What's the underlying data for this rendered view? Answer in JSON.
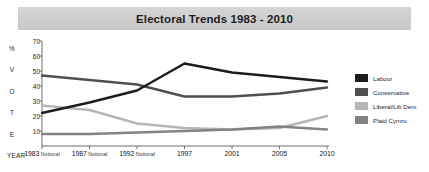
{
  "title": "Electoral Trends 1983 - 2010",
  "axis": {
    "vertical_letters": [
      "%",
      "V",
      "O",
      "T",
      "E"
    ],
    "year_label": "YEAR",
    "yticks": [
      70,
      60,
      50,
      40,
      30,
      20,
      10
    ]
  },
  "legend": [
    {
      "label": "Labour",
      "color": "#1c1c1c"
    },
    {
      "label": "Conservative",
      "color": "#4f4f4f"
    },
    {
      "label": "Liberal/Lib Dem",
      "color": "#b6b6b6"
    },
    {
      "label": "Plaid Cymru",
      "color": "#848484"
    }
  ],
  "chart_data": {
    "type": "line",
    "title": "Electoral Trends 1983 - 2010",
    "xlabel": "YEAR",
    "ylabel": "% VOTE",
    "ylim": [
      0,
      70
    ],
    "grid": false,
    "legend_position": "right",
    "categories": [
      "1983 Notional",
      "1987 Notional",
      "1992 Notional",
      "1997",
      "2001",
      "2005",
      "2010"
    ],
    "category_years": [
      "1983",
      "1987",
      "1992",
      "1997",
      "2001",
      "2005",
      "2010"
    ],
    "category_notes": [
      "Notional",
      "Notional",
      "Notional",
      "",
      "",
      "",
      ""
    ],
    "series": [
      {
        "name": "Labour",
        "color": "#1c1c1c",
        "values": [
          22,
          29,
          37,
          55,
          49,
          46,
          43
        ]
      },
      {
        "name": "Conservative",
        "color": "#4f4f4f",
        "values": [
          47,
          44,
          41,
          33,
          33,
          35,
          39
        ]
      },
      {
        "name": "Liberal/Lib Dem",
        "color": "#b6b6b6",
        "values": [
          27,
          24,
          15,
          12,
          11,
          12,
          20
        ]
      },
      {
        "name": "Plaid Cymru",
        "color": "#848484",
        "values": [
          8,
          8,
          9,
          10,
          11,
          13,
          11
        ]
      }
    ]
  }
}
